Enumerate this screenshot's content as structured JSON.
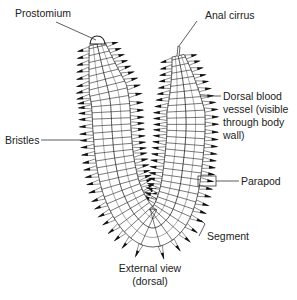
{
  "diagram": {
    "caption_line1": "External view",
    "caption_line2": "(dorsal)",
    "labels": {
      "prostomium": "Prostomium",
      "anal_cirrus": "Anal cirrus",
      "dorsal_line1": "Dorsal blood",
      "dorsal_line2": "vessel (visible",
      "dorsal_line3": "through body",
      "dorsal_line4": "wall)",
      "bristles": "Bristles",
      "parapod": "Parapod",
      "segment": "Segment"
    },
    "colors": {
      "ink": "#222222",
      "bristle": "#111111",
      "body_fill": "#ffffff",
      "background": "#ffffff"
    }
  }
}
